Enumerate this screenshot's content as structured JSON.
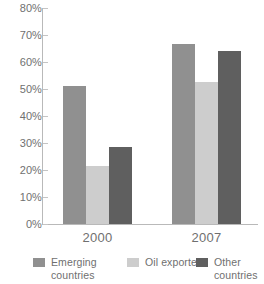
{
  "chart_data": {
    "type": "bar",
    "title": "",
    "subtitle": "",
    "xlabel": "",
    "ylabel": "",
    "categories": [
      "2000",
      "2007"
    ],
    "series": [
      {
        "name": "Emerging\ncountries",
        "legend_label": "Emerging\ncountries",
        "color": "#909090",
        "values": [
          51,
          66.5
        ]
      },
      {
        "name": "Oil exporters",
        "legend_label": "Oil exporters",
        "color": "#cdcdcd",
        "values": [
          21.5,
          52.5
        ]
      },
      {
        "name": "Other\ncountries",
        "legend_label": "Other\ncountries",
        "color": "#5f5f5f",
        "values": [
          28.5,
          64
        ]
      }
    ],
    "ylim": [
      0,
      80
    ],
    "ytick_values": [
      0,
      10,
      20,
      30,
      40,
      50,
      60,
      70,
      80
    ],
    "ytick_labels": [
      "0%",
      "10%",
      "20%",
      "30%",
      "40%",
      "50%",
      "60%",
      "70%",
      "80%"
    ],
    "value_suffix": "%",
    "grid": false,
    "legend_position": "bottom",
    "axis_color": "#b9b9b9",
    "tick_color": "#c4c4c4",
    "text_color": "#6f6f6f",
    "background": "#ffffff"
  }
}
